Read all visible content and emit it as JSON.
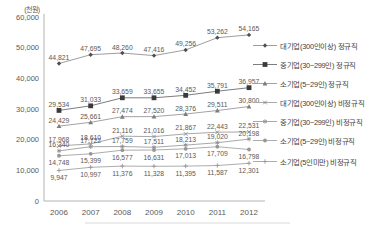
{
  "chart_data": {
    "type": "line",
    "title": "",
    "unit_label": "(천원)",
    "x_categories": [
      "2006",
      "2007",
      "2008",
      "2009",
      "2010",
      "2011",
      "2012"
    ],
    "ylim": [
      0,
      60000
    ],
    "y_tick_step": 10000,
    "y_tick_labels": [
      "0",
      "10,000",
      "20,000",
      "30,000",
      "40,000",
      "50,000",
      "60,000"
    ],
    "grid": false,
    "legend_position": "right",
    "axis_color": "#b3b3b3",
    "tick_label_color": "#595959",
    "data_label_color": "#595959",
    "series": [
      {
        "name": "대기업(300인이상) 정규직",
        "marker": "diamond",
        "line_color": "#9e9e9e",
        "marker_color": "#4f4f4f",
        "label_position": "above",
        "values": [
          44821,
          47695,
          48260,
          47416,
          49256,
          53262,
          54165
        ]
      },
      {
        "name": "중기업(30~299인) 정규직",
        "marker": "square",
        "line_color": "#7d7d7d",
        "marker_color": "#3a3a3a",
        "label_position": "above",
        "values": [
          29534,
          31033,
          33659,
          33655,
          34452,
          35791,
          36957
        ]
      },
      {
        "name": "소기업(5~29인) 정규직",
        "marker": "triangle",
        "line_color": "#a3a3a3",
        "marker_color": "#7d7d7d",
        "label_position": "above",
        "values": [
          24429,
          25661,
          27474,
          27520,
          28376,
          29511,
          30800
        ]
      },
      {
        "name": "대기업(300인이상) 비정규직",
        "marker": "x",
        "line_color": "#a8a8a8",
        "marker_color": "#8c8c8c",
        "label_position": "above",
        "values": [
          17968,
          18610,
          21116,
          21016,
          21867,
          22443,
          22531
        ]
      },
      {
        "name": "중기업(30~299인) 비정규직",
        "marker": "asterisk",
        "line_color": "#a8a8a8",
        "marker_color": "#8c8c8c",
        "label_position": "above",
        "values": [
          16340,
          17722,
          17759,
          17511,
          18213,
          19020,
          20198
        ]
      },
      {
        "name": "소기업(5~29인) 비정규직",
        "marker": "circle",
        "line_color": "#adadad",
        "marker_color": "#969696",
        "label_position": "below",
        "values": [
          14748,
          15399,
          16577,
          16631,
          17013,
          17709,
          16798
        ]
      },
      {
        "name": "소기업(5인미만) 비정규직",
        "marker": "plus",
        "line_color": "#adadad",
        "marker_color": "#969696",
        "label_position": "below",
        "values": [
          9947,
          10997,
          11376,
          11328,
          11395,
          11587,
          12301
        ]
      }
    ]
  }
}
